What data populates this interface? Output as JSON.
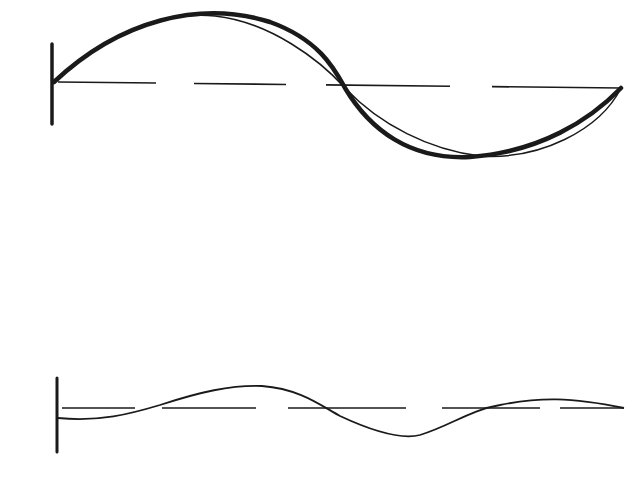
{
  "colors": {
    "background": "#ffffff",
    "ink": "#1a1a1a"
  },
  "top_figure": {
    "wall": {
      "x": 52,
      "y1": 44,
      "y2": 124
    },
    "baseline": {
      "y_start": 82,
      "y_end": 88,
      "dashes": [
        [
          58,
          156
        ],
        [
          194,
          286
        ],
        [
          326,
          450
        ],
        [
          492,
          620
        ]
      ]
    },
    "thick_curve": "M 54 82 C 120 20, 200 0, 270 22 C 320 40, 335 70, 345 88 C 370 130, 410 160, 470 157 C 540 152, 590 120, 621 88",
    "thin_curve": "M 54 82 C 100 40, 160 10, 215 16 C 270 22, 320 60, 345 88 C 380 125, 430 150, 480 156 C 540 160, 600 130, 621 88"
  },
  "bottom_figure": {
    "wall": {
      "x": 57,
      "y1": 378,
      "y2": 452
    },
    "baseline": {
      "y": 408,
      "dashes": [
        [
          62,
          135
        ],
        [
          162,
          256
        ],
        [
          288,
          406
        ],
        [
          442,
          540
        ],
        [
          560,
          624
        ]
      ]
    },
    "curve": "M 58 418 C 100 422, 130 414, 160 405 C 200 392, 230 385, 262 386 C 300 389, 320 405, 340 416 C 370 430, 400 440, 420 435 C 450 426, 470 410, 500 405 C 540 397, 570 397, 624 408"
  }
}
